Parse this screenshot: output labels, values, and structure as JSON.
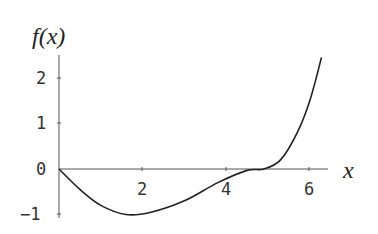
{
  "chart_data": {
    "type": "line",
    "title": "",
    "xlabel": "x",
    "ylabel": "f(x)",
    "xlim": [
      0,
      6.5
    ],
    "ylim": [
      -1.05,
      2.5
    ],
    "x_ticks": [
      "2",
      "4",
      "6"
    ],
    "y_ticks": [
      "2",
      "1",
      "0",
      "-1"
    ],
    "grid": false,
    "legend": null,
    "series": [
      {
        "name": "f(x)",
        "x": [
          0,
          0.5,
          1.0,
          1.6,
          2.2,
          3.0,
          3.8,
          4.5,
          4.9,
          5.3,
          5.7,
          6.0,
          6.28
        ],
        "y": [
          0,
          -0.45,
          -0.8,
          -1.0,
          -0.95,
          -0.7,
          -0.3,
          -0.03,
          0,
          0.2,
          0.8,
          1.5,
          2.45
        ]
      }
    ]
  },
  "labels": {
    "xlabel": "x",
    "ylabel": "f(x)"
  },
  "ticks": {
    "x2": "2",
    "x4": "4",
    "x6": "6",
    "y2": "2",
    "y1": "1",
    "y0": "0",
    "ym1": "−1"
  }
}
